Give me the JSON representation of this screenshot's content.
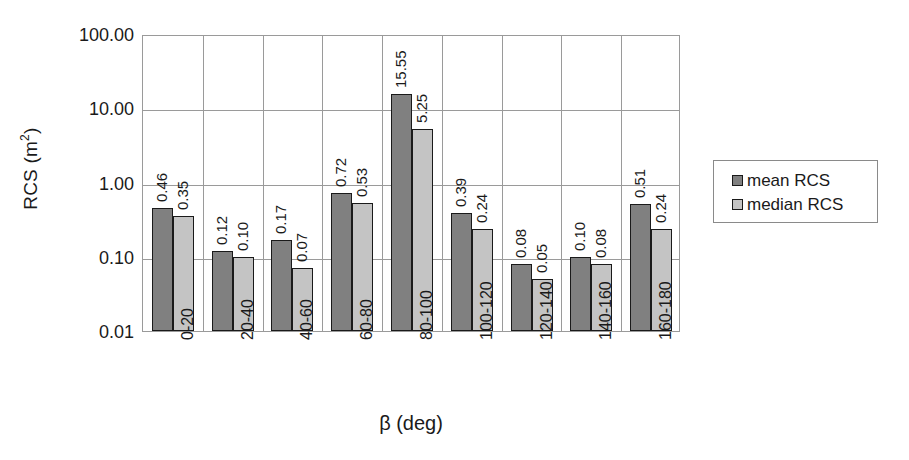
{
  "chart_data": {
    "type": "bar",
    "title": "",
    "xlabel": "β (deg)",
    "ylabel": "RCS (m²)",
    "ylabel_base": "RCS (m",
    "ylabel_sup": "2",
    "ylabel_tail": ")",
    "yscale": "log",
    "ylim": [
      0.01,
      100
    ],
    "y_ticks": [
      "0.01",
      "0.10",
      "1.00",
      "10.00",
      "100.00"
    ],
    "y_tick_values": [
      0.01,
      0.1,
      1.0,
      10.0,
      100.0
    ],
    "grid": "both",
    "legend_position": "right",
    "categories": [
      "0-20",
      "20-40",
      "40-60",
      "60-80",
      "80-100",
      "100-120",
      "120-140",
      "140-160",
      "160-180"
    ],
    "series": [
      {
        "name": "mean RCS",
        "color": "#808080",
        "values": [
          0.46,
          0.12,
          0.17,
          0.72,
          15.55,
          0.39,
          0.08,
          0.1,
          0.51
        ],
        "labels": [
          "0.46",
          "0.12",
          "0.17",
          "0.72",
          "15.55",
          "0.39",
          "0.08",
          "0.10",
          "0.51"
        ]
      },
      {
        "name": "median RCS",
        "color": "#c4c4c4",
        "values": [
          0.35,
          0.1,
          0.07,
          0.53,
          5.25,
          0.24,
          0.05,
          0.08,
          0.24
        ],
        "labels": [
          "0.35",
          "0.10",
          "0.07",
          "0.53",
          "5.25",
          "0.24",
          "0.05",
          "0.08",
          "0.24"
        ]
      }
    ]
  },
  "legend": {
    "items": [
      {
        "label": "mean RCS",
        "color": "#808080"
      },
      {
        "label": "median RCS",
        "color": "#c4c4c4"
      }
    ]
  },
  "colors": {
    "mean_bar": "#808080",
    "median_bar": "#c4c4c4",
    "bar_outline": "#1a1a1a",
    "grid": "#9a9a9a",
    "background": "#ffffff",
    "text": "#1a1a1a"
  }
}
